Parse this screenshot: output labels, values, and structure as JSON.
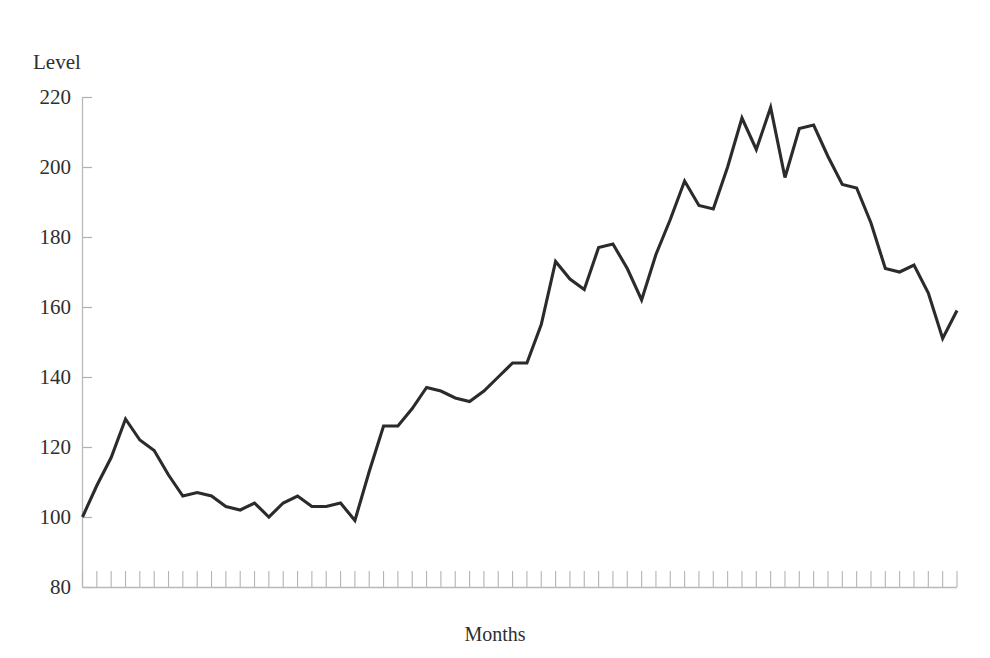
{
  "chart_data": {
    "type": "line",
    "title": "",
    "xlabel": "Months",
    "ylabel": "Level",
    "ylim": [
      80,
      220
    ],
    "yticks": [
      80,
      100,
      120,
      140,
      160,
      180,
      200,
      220
    ],
    "ytick_labels": [
      "80",
      "100",
      "120",
      "140",
      "160",
      "180",
      "200",
      "220"
    ],
    "xlim": [
      0,
      61
    ],
    "xticks_count": 62,
    "xtick_labels": [],
    "grid": false,
    "legend": null,
    "series": [
      {
        "name": "Level",
        "color": "#2b2b2b",
        "x": [
          0,
          1,
          2,
          3,
          4,
          5,
          6,
          7,
          8,
          9,
          10,
          11,
          12,
          13,
          14,
          15,
          16,
          17,
          18,
          19,
          20,
          21,
          22,
          23,
          24,
          25,
          26,
          27,
          28,
          29,
          30,
          31,
          32,
          33,
          34,
          35,
          36,
          37,
          38,
          39,
          40,
          41,
          42,
          43,
          44,
          45,
          46,
          47,
          48,
          49,
          50,
          51,
          52,
          53,
          54,
          55,
          56,
          57,
          58,
          59,
          60,
          61
        ],
        "values": [
          100,
          109,
          117,
          128,
          122,
          119,
          112,
          106,
          107,
          106,
          103,
          102,
          104,
          100,
          104,
          106,
          103,
          103,
          104,
          99,
          113,
          126,
          126,
          131,
          137,
          136,
          134,
          133,
          136,
          140,
          144,
          144,
          155,
          173,
          168,
          165,
          177,
          178,
          171,
          162,
          175,
          185,
          196,
          189,
          188,
          200,
          214,
          205,
          217,
          197,
          211,
          212,
          203,
          195,
          194,
          184,
          171,
          170,
          172,
          164,
          151,
          159
        ]
      }
    ]
  },
  "axis": {
    "ylabel_caption": "Level",
    "xlabel_caption": "Months"
  }
}
